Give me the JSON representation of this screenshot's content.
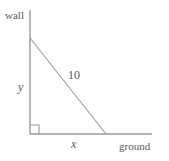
{
  "figure": {
    "labels": {
      "wall": "wall",
      "ground": "ground",
      "vertical_leg": "y",
      "horizontal_leg": "x",
      "hypotenuse": "10"
    },
    "colors": {
      "line": "#9a9a9a",
      "text": "#595959",
      "background": "#ffffff"
    }
  },
  "chart_data": {
    "type": "diagram",
    "shape": "right-triangle",
    "annotations": [
      {
        "name": "wall",
        "text": "wall",
        "role": "axis-label",
        "position": "top-left"
      },
      {
        "name": "ground",
        "text": "ground",
        "role": "axis-label",
        "position": "bottom-right"
      },
      {
        "name": "y",
        "text": "y",
        "role": "side-length",
        "side": "vertical-leg"
      },
      {
        "name": "x",
        "text": "x",
        "role": "side-length",
        "side": "horizontal-leg"
      },
      {
        "name": "hypotenuse",
        "text": "10",
        "role": "side-length",
        "side": "hypotenuse"
      }
    ],
    "segments": [
      {
        "name": "wall-line",
        "x1": 30,
        "y1": 10,
        "x2": 30,
        "y2": 134
      },
      {
        "name": "ground-line",
        "x1": 30,
        "y1": 134,
        "x2": 152,
        "y2": 134
      },
      {
        "name": "hypotenuse-line",
        "x1": 30,
        "y1": 38,
        "x2": 106,
        "y2": 134
      }
    ],
    "right_angle_marker": {
      "x": 30,
      "y": 125,
      "size": 9,
      "corner": "bottom-left"
    },
    "grid": false,
    "legend": false
  }
}
